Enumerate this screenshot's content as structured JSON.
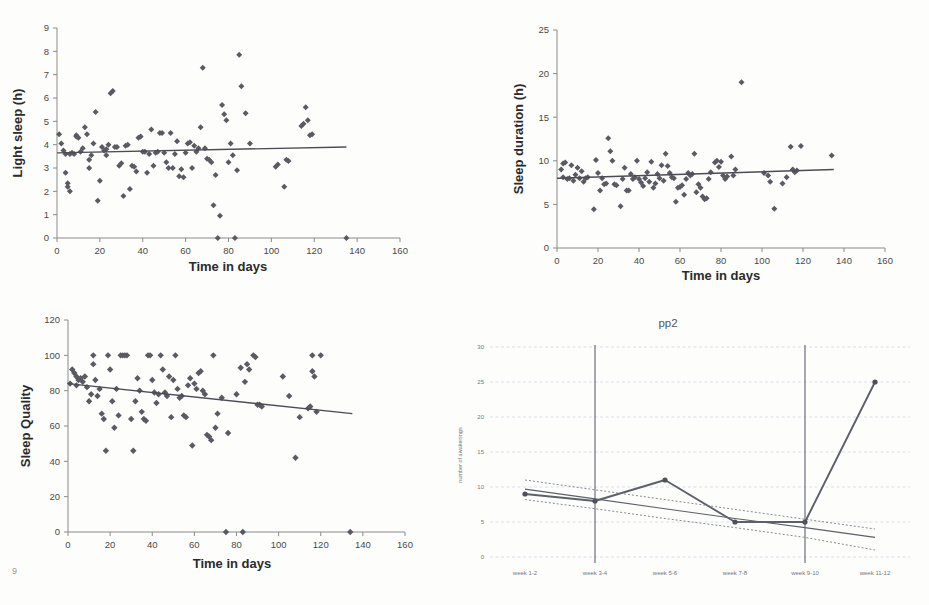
{
  "document": {
    "background_color": "#fdfdfc",
    "marker_color": "#5a5a62",
    "trend_color": "#4c4c54",
    "grid_color": "#c9cfe0",
    "artifact_bottom_left": "9"
  },
  "chart_data": [
    {
      "id": "light-sleep",
      "type": "scatter",
      "title": "",
      "xlabel": "Time in days",
      "ylabel": "Light sleep (h)",
      "xlim": [
        0,
        160
      ],
      "ylim": [
        0,
        9
      ],
      "xticks": [
        0,
        20,
        40,
        60,
        80,
        100,
        120,
        140,
        160
      ],
      "yticks": [
        0,
        1,
        2,
        3,
        4,
        5,
        6,
        7,
        8,
        9
      ],
      "grid": false,
      "legend": "none",
      "trendline": {
        "x": [
          0,
          135
        ],
        "y": [
          3.65,
          3.9
        ],
        "style": "solid"
      },
      "points": [
        [
          1,
          4.45
        ],
        [
          2,
          4.05
        ],
        [
          3,
          3.75
        ],
        [
          4,
          2.8
        ],
        [
          4,
          3.6
        ],
        [
          5,
          2.2
        ],
        [
          5,
          2.35
        ],
        [
          6,
          3.6
        ],
        [
          6,
          2.0
        ],
        [
          7,
          3.65
        ],
        [
          8,
          3.6
        ],
        [
          9,
          4.35
        ],
        [
          9,
          4.4
        ],
        [
          10,
          4.3
        ],
        [
          11,
          3.7
        ],
        [
          12,
          3.85
        ],
        [
          13,
          4.75
        ],
        [
          14,
          4.45
        ],
        [
          15,
          3.0
        ],
        [
          15,
          3.35
        ],
        [
          16,
          3.55
        ],
        [
          17,
          4.05
        ],
        [
          18,
          5.4
        ],
        [
          19,
          1.6
        ],
        [
          20,
          2.45
        ],
        [
          21,
          3.9
        ],
        [
          22,
          3.75
        ],
        [
          23,
          3.8
        ],
        [
          23,
          3.55
        ],
        [
          24,
          4.0
        ],
        [
          25,
          6.2
        ],
        [
          26,
          6.3
        ],
        [
          27,
          3.9
        ],
        [
          28,
          3.9
        ],
        [
          29,
          3.1
        ],
        [
          30,
          3.2
        ],
        [
          31,
          1.8
        ],
        [
          32,
          3.95
        ],
        [
          33,
          4.0
        ],
        [
          34,
          2.1
        ],
        [
          35,
          3.1
        ],
        [
          36,
          3.05
        ],
        [
          37,
          2.85
        ],
        [
          38,
          4.3
        ],
        [
          39,
          4.35
        ],
        [
          40,
          3.7
        ],
        [
          41,
          3.7
        ],
        [
          42,
          2.8
        ],
        [
          43,
          3.6
        ],
        [
          44,
          4.65
        ],
        [
          45,
          3.1
        ],
        [
          46,
          3.65
        ],
        [
          47,
          3.7
        ],
        [
          48,
          4.5
        ],
        [
          49,
          4.5
        ],
        [
          50,
          3.65
        ],
        [
          51,
          3.25
        ],
        [
          52,
          3.0
        ],
        [
          53,
          4.5
        ],
        [
          54,
          3.0
        ],
        [
          55,
          3.6
        ],
        [
          56,
          4.15
        ],
        [
          57,
          2.65
        ],
        [
          58,
          2.95
        ],
        [
          59,
          2.6
        ],
        [
          60,
          3.65
        ],
        [
          61,
          4.05
        ],
        [
          62,
          4.1
        ],
        [
          63,
          3.0
        ],
        [
          64,
          3.95
        ],
        [
          65,
          3.7
        ],
        [
          66,
          3.85
        ],
        [
          67,
          4.75
        ],
        [
          68,
          7.3
        ],
        [
          69,
          3.85
        ],
        [
          70,
          3.4
        ],
        [
          71,
          3.35
        ],
        [
          72,
          3.25
        ],
        [
          73,
          1.4
        ],
        [
          74,
          2.7
        ],
        [
          75,
          0.0
        ],
        [
          76,
          0.95
        ],
        [
          77,
          5.7
        ],
        [
          78,
          5.3
        ],
        [
          79,
          5.05
        ],
        [
          80,
          3.25
        ],
        [
          81,
          4.05
        ],
        [
          82,
          3.55
        ],
        [
          83,
          0.0
        ],
        [
          84,
          2.9
        ],
        [
          85,
          7.85
        ],
        [
          86,
          6.5
        ],
        [
          88,
          5.35
        ],
        [
          90,
          4.05
        ],
        [
          102,
          3.05
        ],
        [
          103,
          3.15
        ],
        [
          106,
          2.2
        ],
        [
          107,
          3.35
        ],
        [
          108,
          3.3
        ],
        [
          114,
          4.8
        ],
        [
          115,
          4.9
        ],
        [
          116,
          5.6
        ],
        [
          117,
          5.05
        ],
        [
          118,
          4.4
        ],
        [
          119,
          4.45
        ],
        [
          135,
          0.0
        ]
      ]
    },
    {
      "id": "sleep-duration",
      "type": "scatter",
      "title": "",
      "xlabel": "Time in days",
      "ylabel": "Sleep duration (h)",
      "xlim": [
        0,
        160
      ],
      "ylim": [
        0,
        25
      ],
      "xticks": [
        0,
        20,
        40,
        60,
        80,
        100,
        120,
        140,
        160
      ],
      "yticks": [
        0,
        5,
        10,
        15,
        20,
        25
      ],
      "grid": false,
      "legend": "none",
      "trendline": {
        "x": [
          0,
          135
        ],
        "y": [
          8.0,
          9.0
        ],
        "style": "solid"
      },
      "points": [
        [
          2,
          9.0
        ],
        [
          3,
          8.1
        ],
        [
          3,
          9.7
        ],
        [
          4,
          9.8
        ],
        [
          5,
          7.9
        ],
        [
          6,
          8.0
        ],
        [
          7,
          9.5
        ],
        [
          8,
          7.7
        ],
        [
          9,
          8.4
        ],
        [
          10,
          9.2
        ],
        [
          11,
          8.0
        ],
        [
          12,
          8.8
        ],
        [
          13,
          7.6
        ],
        [
          14,
          8.0
        ],
        [
          15,
          8.1
        ],
        [
          18,
          4.45
        ],
        [
          19,
          10.1
        ],
        [
          20,
          8.6
        ],
        [
          21,
          6.6
        ],
        [
          22,
          8.0
        ],
        [
          23,
          7.3
        ],
        [
          24,
          7.4
        ],
        [
          25,
          12.6
        ],
        [
          26,
          11.1
        ],
        [
          27,
          10.0
        ],
        [
          28,
          7.3
        ],
        [
          29,
          7.2
        ],
        [
          31,
          4.8
        ],
        [
          32,
          7.9
        ],
        [
          33,
          9.2
        ],
        [
          34,
          6.6
        ],
        [
          35,
          6.6
        ],
        [
          36,
          8.5
        ],
        [
          37,
          7.9
        ],
        [
          38,
          8.1
        ],
        [
          39,
          10.0
        ],
        [
          40,
          7.9
        ],
        [
          41,
          7.5
        ],
        [
          42,
          7.1
        ],
        [
          43,
          8.0
        ],
        [
          44,
          8.7
        ],
        [
          45,
          7.6
        ],
        [
          46,
          9.9
        ],
        [
          47,
          6.9
        ],
        [
          48,
          7.4
        ],
        [
          49,
          8.5
        ],
        [
          50,
          8.0
        ],
        [
          51,
          9.5
        ],
        [
          52,
          7.7
        ],
        [
          53,
          10.8
        ],
        [
          54,
          9.4
        ],
        [
          55,
          8.6
        ],
        [
          56,
          8.1
        ],
        [
          57,
          8.0
        ],
        [
          58,
          5.3
        ],
        [
          59,
          6.9
        ],
        [
          60,
          7.0
        ],
        [
          61,
          7.2
        ],
        [
          62,
          6.1
        ],
        [
          63,
          7.9
        ],
        [
          64,
          8.6
        ],
        [
          65,
          8.3
        ],
        [
          66,
          8.5
        ],
        [
          67,
          10.8
        ],
        [
          68,
          6.4
        ],
        [
          69,
          7.3
        ],
        [
          70,
          6.9
        ],
        [
          71,
          5.9
        ],
        [
          72,
          5.6
        ],
        [
          73,
          5.7
        ],
        [
          74,
          7.9
        ],
        [
          75,
          8.7
        ],
        [
          77,
          9.8
        ],
        [
          78,
          10.0
        ],
        [
          79,
          9.3
        ],
        [
          80,
          9.9
        ],
        [
          81,
          8.3
        ],
        [
          82,
          7.9
        ],
        [
          83,
          8.2
        ],
        [
          85,
          10.5
        ],
        [
          86,
          8.3
        ],
        [
          87,
          9.0
        ],
        [
          90,
          19.0
        ],
        [
          101,
          8.6
        ],
        [
          103,
          8.3
        ],
        [
          104,
          7.6
        ],
        [
          106,
          4.5
        ],
        [
          110,
          7.4
        ],
        [
          112,
          8.1
        ],
        [
          114,
          11.6
        ],
        [
          115,
          9.0
        ],
        [
          116,
          8.7
        ],
        [
          117,
          8.9
        ],
        [
          119,
          11.7
        ],
        [
          134,
          10.6
        ]
      ]
    },
    {
      "id": "sleep-quality",
      "type": "scatter",
      "title": "",
      "xlabel": "Time in days",
      "ylabel": "Sleep Quality",
      "xlim": [
        0,
        160
      ],
      "ylim": [
        0,
        120
      ],
      "xticks": [
        0,
        20,
        40,
        60,
        80,
        100,
        120,
        140,
        160
      ],
      "yticks": [
        0,
        20,
        40,
        60,
        80,
        100,
        120
      ],
      "grid": false,
      "legend": "none",
      "trendline": {
        "x": [
          0,
          135
        ],
        "y": [
          84,
          67
        ],
        "style": "solid"
      },
      "points": [
        [
          1,
          84
        ],
        [
          2,
          92
        ],
        [
          3,
          90
        ],
        [
          4,
          83
        ],
        [
          4,
          88
        ],
        [
          5,
          86
        ],
        [
          6,
          87
        ],
        [
          7,
          85
        ],
        [
          8,
          88
        ],
        [
          9,
          82
        ],
        [
          10,
          74
        ],
        [
          11,
          78
        ],
        [
          12,
          100
        ],
        [
          12,
          95
        ],
        [
          13,
          86
        ],
        [
          14,
          77
        ],
        [
          15,
          81
        ],
        [
          16,
          67
        ],
        [
          17,
          64
        ],
        [
          18,
          46
        ],
        [
          19,
          100
        ],
        [
          20,
          92
        ],
        [
          21,
          74
        ],
        [
          22,
          59
        ],
        [
          23,
          81
        ],
        [
          24,
          66
        ],
        [
          25,
          100
        ],
        [
          26,
          100
        ],
        [
          27,
          100
        ],
        [
          28,
          100
        ],
        [
          30,
          64
        ],
        [
          31,
          46
        ],
        [
          32,
          74
        ],
        [
          33,
          87
        ],
        [
          34,
          80
        ],
        [
          35,
          68
        ],
        [
          36,
          64
        ],
        [
          37,
          63
        ],
        [
          38,
          100
        ],
        [
          39,
          100
        ],
        [
          40,
          86
        ],
        [
          41,
          79
        ],
        [
          42,
          73
        ],
        [
          43,
          78
        ],
        [
          44,
          100
        ],
        [
          45,
          92
        ],
        [
          46,
          79
        ],
        [
          47,
          77
        ],
        [
          48,
          88
        ],
        [
          49,
          65
        ],
        [
          50,
          86
        ],
        [
          51,
          100
        ],
        [
          52,
          81
        ],
        [
          53,
          76
        ],
        [
          54,
          77
        ],
        [
          55,
          66
        ],
        [
          56,
          65
        ],
        [
          57,
          83
        ],
        [
          58,
          87
        ],
        [
          59,
          49
        ],
        [
          60,
          84
        ],
        [
          61,
          81
        ],
        [
          62,
          90
        ],
        [
          63,
          91
        ],
        [
          64,
          80
        ],
        [
          65,
          78
        ],
        [
          66,
          55
        ],
        [
          67,
          54
        ],
        [
          68,
          52
        ],
        [
          69,
          100
        ],
        [
          70,
          59
        ],
        [
          71,
          67
        ],
        [
          73,
          76
        ],
        [
          75,
          0
        ],
        [
          76,
          56
        ],
        [
          80,
          78
        ],
        [
          82,
          93
        ],
        [
          83,
          0
        ],
        [
          84,
          85
        ],
        [
          85,
          95
        ],
        [
          86,
          92
        ],
        [
          88,
          100
        ],
        [
          89,
          99
        ],
        [
          90,
          72
        ],
        [
          91,
          72
        ],
        [
          92,
          71
        ],
        [
          102,
          88
        ],
        [
          105,
          77
        ],
        [
          108,
          42
        ],
        [
          110,
          65
        ],
        [
          114,
          70
        ],
        [
          115,
          71
        ],
        [
          116,
          100
        ],
        [
          116,
          91
        ],
        [
          117,
          88
        ],
        [
          118,
          68
        ],
        [
          120,
          100
        ],
        [
          134,
          0
        ]
      ]
    },
    {
      "id": "pp2-awakenings",
      "type": "line",
      "title": "pp2",
      "xlabel": "",
      "ylabel": "number of awakenings",
      "categories": [
        "week 1-2",
        "week 3-4",
        "week 5-6",
        "week 7-8",
        "week 9-10",
        "week 11-12"
      ],
      "values": [
        9,
        8,
        11,
        5,
        5,
        25
      ],
      "ylim": [
        0,
        30
      ],
      "yticks": [
        0,
        5,
        10,
        15,
        20,
        25,
        30
      ],
      "grid": true,
      "legend": "none",
      "series": [
        {
          "name": "number of awakenings",
          "values": [
            9,
            8,
            11,
            5,
            5,
            25
          ],
          "style": "solid-marker"
        },
        {
          "name": "trend",
          "values": [
            9.7,
            8.3,
            6.9,
            5.5,
            4.2,
            2.8
          ],
          "style": "solid"
        },
        {
          "name": "upper-ci",
          "values": [
            11.0,
            9.6,
            8.2,
            6.8,
            5.4,
            4.0
          ],
          "style": "dotted"
        },
        {
          "name": "lower-ci",
          "values": [
            8.2,
            6.9,
            5.5,
            4.2,
            2.8,
            1.0
          ],
          "style": "dotted"
        }
      ],
      "dividers": [
        "week 3-4",
        "week 9-10"
      ]
    }
  ]
}
